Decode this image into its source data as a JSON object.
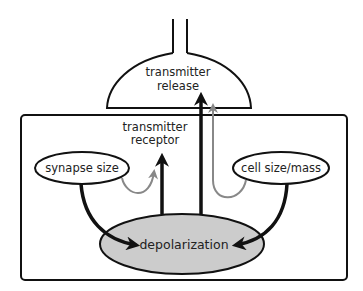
{
  "diagram": {
    "title": "",
    "colors": {
      "stroke": "#111111",
      "grey_arrow": "#888888",
      "depolarization_fill": "#cccccc",
      "background": "#ffffff"
    },
    "nodes": {
      "presynaptic_terminal": {
        "label_line1": "transmitter",
        "label_line2": "release"
      },
      "postsynaptic_cell": {
        "label": ""
      },
      "receptor": {
        "label_line1": "transmitter",
        "label_line2": "receptor"
      },
      "synapse_size": {
        "label": "synapse size"
      },
      "cell_size": {
        "label": "cell size/mass"
      },
      "depolarization": {
        "label": "depolarization"
      }
    },
    "edges": [
      {
        "from": "synapse_size",
        "to": "depolarization",
        "style": "black-thick"
      },
      {
        "from": "cell_size",
        "to": "depolarization",
        "style": "black-thick"
      },
      {
        "from": "depolarization",
        "to": "receptor",
        "style": "black-thick"
      },
      {
        "from": "depolarization",
        "to": "presynaptic_terminal",
        "style": "black-thick"
      },
      {
        "from": "synapse_size",
        "to": "receptor",
        "style": "grey-thin"
      },
      {
        "from": "cell_size",
        "to": "presynaptic_terminal",
        "style": "grey-thin"
      }
    ]
  }
}
